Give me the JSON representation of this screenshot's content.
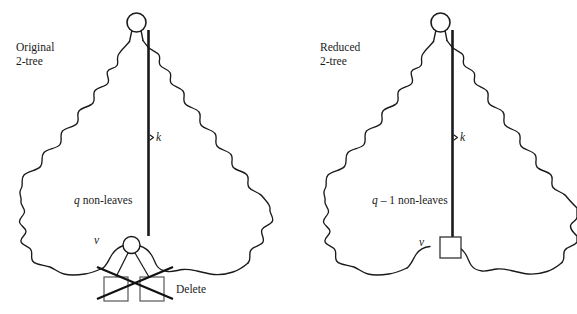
{
  "figure": {
    "title": "",
    "background_color": "#ffffff",
    "stroke_color": "#1a1a1a",
    "text_color": "#1a1a1a",
    "width": 577,
    "height": 314
  },
  "panels": [
    {
      "id": "original",
      "caption_line1": "Original",
      "caption_line2": "2-tree",
      "path_label": "k",
      "region_label": "q non-leaves",
      "node_label": "v",
      "node_shape": "circle",
      "root_shape": "circle",
      "action_label": "Delete",
      "leaves": 2,
      "leaf_shape": "square",
      "crossed_out": true
    },
    {
      "id": "reduced",
      "caption_line1": "Reduced",
      "caption_line2": "2-tree",
      "path_label": "k",
      "region_label": "q – 1 non-leaves",
      "node_label": "v",
      "node_shape": "square",
      "root_shape": "circle",
      "action_label": "",
      "leaves": 0,
      "leaf_shape": "square",
      "crossed_out": false
    }
  ],
  "labels": {
    "original_caption_1": "Original",
    "original_caption_2": "2-tree",
    "reduced_caption_1": "Reduced",
    "reduced_caption_2": "2-tree",
    "k_left": "k",
    "k_right": "k",
    "q_nonleaves": "q non-leaves",
    "q_minus_1_nonleaves": "q – 1 non-leaves",
    "v_left": "v",
    "v_right": "v",
    "delete": "Delete"
  }
}
